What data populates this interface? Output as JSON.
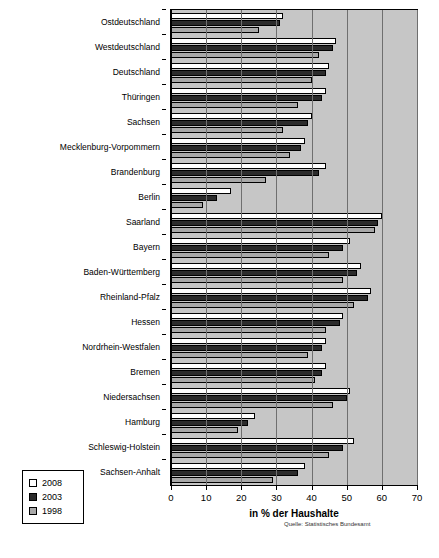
{
  "chart_data": {
    "type": "bar",
    "orientation": "horizontal",
    "title": "",
    "xlabel": "in % der Haushalte",
    "ylabel": "",
    "xlim": [
      0,
      70
    ],
    "xticks": [
      0,
      10,
      20,
      30,
      40,
      50,
      60,
      70
    ],
    "grid": true,
    "legend_position": "bottom-left",
    "source_note": "Quelle: Statistisches Bundesamt",
    "categories": [
      "Ostdeutschland",
      "Westdeutschland",
      "Deutschland",
      "Thüringen",
      "Sachsen",
      "Mecklenburg-Vorpommern",
      "Brandenburg",
      "Berlin",
      "Saarland",
      "Bayern",
      "Baden-Württemberg",
      "Rheinland-Pfalz",
      "Hessen",
      "Nordrhein-Westfalen",
      "Bremen",
      "Niedersachsen",
      "Hamburg",
      "Schleswig-Holstein",
      "Sachsen-Anhalt"
    ],
    "series": [
      {
        "name": "2008",
        "color": "#ffffff",
        "values": [
          32,
          47,
          45,
          44,
          40,
          38,
          44,
          17,
          60,
          51,
          54,
          57,
          49,
          44,
          44,
          51,
          24,
          52,
          38
        ]
      },
      {
        "name": "2003",
        "color": "#2b2b2b",
        "values": [
          31,
          46,
          44,
          43,
          39,
          37,
          42,
          13,
          59,
          49,
          53,
          56,
          48,
          43,
          43,
          50,
          22,
          49,
          36
        ]
      },
      {
        "name": "1998",
        "color": "#a8a8a8",
        "values": [
          25,
          42,
          40,
          36,
          32,
          34,
          27,
          9,
          58,
          45,
          49,
          52,
          44,
          39,
          41,
          46,
          19,
          45,
          29
        ]
      }
    ]
  },
  "legend": {
    "items": [
      {
        "label": "2008",
        "swatch": "y2008"
      },
      {
        "label": "2003",
        "swatch": "y2003"
      },
      {
        "label": "1998",
        "swatch": "y1998"
      }
    ]
  },
  "axis": {
    "x_title": "in % der Haushalte",
    "tick_labels": [
      "0",
      "10",
      "20",
      "30",
      "40",
      "50",
      "60",
      "70"
    ]
  },
  "footer": {
    "source": "Quelle: Statistisches Bundesamt"
  }
}
